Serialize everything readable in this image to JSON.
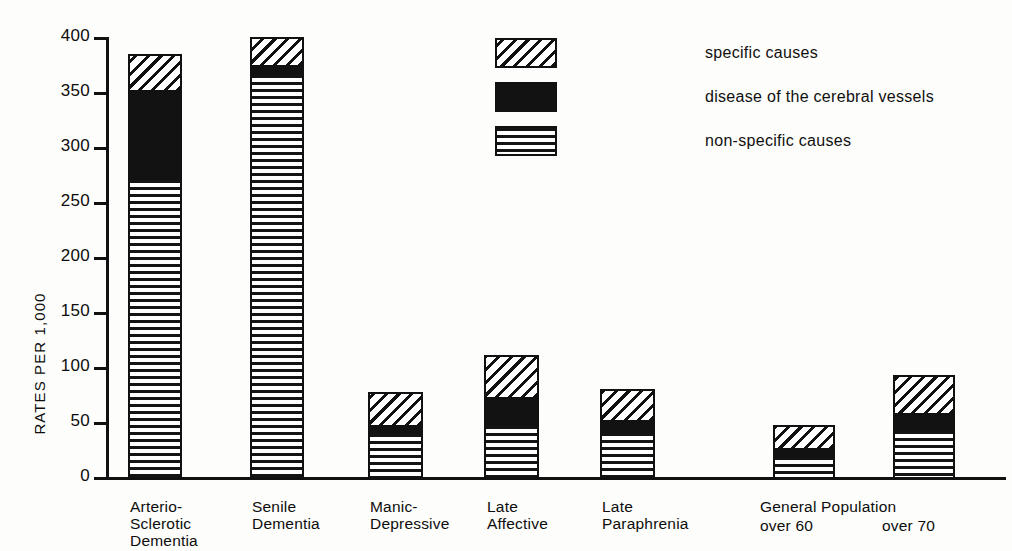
{
  "chart_data": {
    "type": "bar",
    "title": "",
    "subtitle": "",
    "xlabel": "",
    "ylabel": "RATES PER 1,000",
    "ylim": [
      0,
      400
    ],
    "yticks": [
      0,
      50,
      100,
      150,
      200,
      250,
      300,
      350,
      400
    ],
    "ytick_labels": [
      "0",
      "50",
      "100",
      "150",
      "200",
      "250",
      "300",
      "350",
      "400"
    ],
    "grid": false,
    "stacked": true,
    "legend_position": "top-center",
    "categories": [
      "Arterio-\nSclerotic\nDementia",
      "Senile\nDementia",
      "Manic-\nDepressive",
      "Late\nAffective",
      "Late\nParaphrenia",
      "over 60",
      "over 70"
    ],
    "series": [
      {
        "name": "non-specific causes",
        "pattern": "horizontal-lines",
        "values": [
          272,
          367,
          41,
          48,
          42,
          20,
          44
        ]
      },
      {
        "name": "disease of the cerebral vessels",
        "pattern": "solid-black",
        "values": [
          80,
          8,
          6,
          25,
          10,
          6,
          14
        ]
      },
      {
        "name": "specific causes",
        "pattern": "diagonal-hatch",
        "values": [
          33,
          25,
          30,
          38,
          28,
          21,
          35
        ]
      }
    ],
    "totals": [
      385,
      400,
      77,
      111,
      80,
      47,
      93
    ],
    "annotations": [
      "General Population"
    ]
  },
  "axis": {
    "y_title": "RATES PER 1,000",
    "ticks": [
      {
        "value": 400,
        "label": "400"
      },
      {
        "value": 350,
        "label": "350"
      },
      {
        "value": 300,
        "label": "300"
      },
      {
        "value": 250,
        "label": "250"
      },
      {
        "value": 200,
        "label": "200"
      },
      {
        "value": 150,
        "label": "150"
      },
      {
        "value": 100,
        "label": "100"
      },
      {
        "value": 50,
        "label": "50"
      },
      {
        "value": 0,
        "label": "0"
      }
    ]
  },
  "legend": {
    "items": [
      {
        "label": "specific causes",
        "pattern": "diagonal-hatch"
      },
      {
        "label": "disease of the cerebral vessels",
        "pattern": "solid-black"
      },
      {
        "label": "non-specific causes",
        "pattern": "horizontal-lines"
      }
    ]
  },
  "xaxis": {
    "labels": [
      {
        "line1": "Arterio-",
        "line2": "Sclerotic",
        "line3": "Dementia"
      },
      {
        "line1": "Senile",
        "line2": "Dementia",
        "line3": ""
      },
      {
        "line1": "Manic-",
        "line2": "Depressive",
        "line3": ""
      },
      {
        "line1": "Late",
        "line2": "Affective",
        "line3": ""
      },
      {
        "line1": "Late",
        "line2": "Paraphrenia",
        "line3": ""
      }
    ],
    "group": {
      "heading": "General Population",
      "sub_left": "over 60",
      "sub_right": "over 70"
    }
  },
  "colors": {
    "ink": "#111111",
    "paper": "#fdfdfb"
  }
}
